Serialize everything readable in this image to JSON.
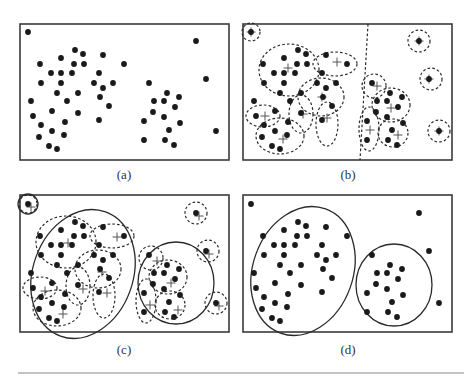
{
  "figure": {
    "panels": [
      {
        "id": "a",
        "label": "(a)",
        "mode": "points"
      },
      {
        "id": "b",
        "label": "(b)",
        "mode": "micro-clusters"
      },
      {
        "id": "c",
        "label": "(c)",
        "mode": "macro-clusters-over-micro"
      },
      {
        "id": "d",
        "label": "(d)",
        "mode": "final-clusters"
      }
    ],
    "points": [
      [
        8,
        8
      ],
      [
        55,
        26
      ],
      [
        63,
        30
      ],
      [
        83,
        31
      ],
      [
        41,
        34
      ],
      [
        20,
        40
      ],
      [
        54,
        40
      ],
      [
        64,
        40
      ],
      [
        104,
        40
      ],
      [
        31,
        49
      ],
      [
        41,
        49
      ],
      [
        52,
        49
      ],
      [
        79,
        49
      ],
      [
        21,
        59
      ],
      [
        41,
        59
      ],
      [
        74,
        59
      ],
      [
        93,
        59
      ],
      [
        83,
        64
      ],
      [
        37,
        69
      ],
      [
        58,
        69
      ],
      [
        80,
        73
      ],
      [
        11,
        77
      ],
      [
        47,
        77
      ],
      [
        89,
        82
      ],
      [
        32,
        87
      ],
      [
        58,
        89
      ],
      [
        13,
        92
      ],
      [
        79,
        96
      ],
      [
        45,
        98
      ],
      [
        21,
        101
      ],
      [
        32,
        107
      ],
      [
        44,
        111
      ],
      [
        19,
        113
      ],
      [
        29,
        122
      ],
      [
        37,
        125
      ],
      [
        176,
        17
      ],
      [
        186,
        55
      ],
      [
        196,
        107
      ],
      [
        129,
        59
      ],
      [
        147,
        69
      ],
      [
        159,
        73
      ],
      [
        134,
        77
      ],
      [
        144,
        77
      ],
      [
        155,
        83
      ],
      [
        133,
        88
      ],
      [
        144,
        93
      ],
      [
        124,
        97
      ],
      [
        160,
        99
      ],
      [
        149,
        106
      ],
      [
        124,
        116
      ],
      [
        145,
        116
      ],
      [
        154,
        121
      ]
    ],
    "micro_clusters": [
      {
        "cx": 8,
        "cy": 8,
        "rx": 9,
        "ry": 9,
        "center": [
          8,
          8
        ]
      },
      {
        "cx": 46,
        "cy": 46,
        "rx": 30,
        "ry": 26,
        "center": [
          45,
          44
        ]
      },
      {
        "cx": 92,
        "cy": 40,
        "rx": 22,
        "ry": 12,
        "center": [
          94,
          38
        ]
      },
      {
        "cx": 78,
        "cy": 73,
        "rx": 23,
        "ry": 19,
        "center": [
          79,
          73
        ]
      },
      {
        "cx": 20,
        "cy": 92,
        "rx": 17,
        "ry": 11,
        "center": [
          22,
          92
        ]
      },
      {
        "cx": 58,
        "cy": 90,
        "rx": 12,
        "ry": 19,
        "center": [
          60,
          90
        ]
      },
      {
        "cx": 84,
        "cy": 100,
        "rx": 11,
        "ry": 22,
        "center": [
          84,
          94
        ]
      },
      {
        "cx": 37,
        "cy": 112,
        "rx": 24,
        "ry": 18,
        "center": [
          40,
          115
        ]
      },
      {
        "cx": 176,
        "cy": 17,
        "rx": 11,
        "ry": 11,
        "center": [
          176,
          17
        ]
      },
      {
        "cx": 188,
        "cy": 55,
        "rx": 11,
        "ry": 11,
        "center": [
          186,
          55
        ]
      },
      {
        "cx": 196,
        "cy": 107,
        "rx": 11,
        "ry": 11,
        "center": [
          196,
          107
        ]
      },
      {
        "cx": 131,
        "cy": 62,
        "rx": 12,
        "ry": 12,
        "center": [
          134,
          62
        ]
      },
      {
        "cx": 148,
        "cy": 81,
        "rx": 19,
        "ry": 17,
        "center": [
          148,
          84
        ]
      },
      {
        "cx": 126,
        "cy": 105,
        "rx": 10,
        "ry": 22,
        "center": [
          127,
          106
        ]
      },
      {
        "cx": 150,
        "cy": 109,
        "rx": 15,
        "ry": 14,
        "center": [
          155,
          111
        ]
      }
    ],
    "separator": {
      "x_top": 125,
      "x_bottom": 117
    },
    "macro_clusters": [
      {
        "cx": 8,
        "cy": 8,
        "rx": 10,
        "ry": 10
      },
      {
        "cx": 63,
        "cy": 78,
        "rx": 50,
        "ry": 66,
        "rot": 20
      },
      {
        "cx": 156,
        "cy": 87,
        "rx": 38,
        "ry": 41,
        "rot": 0
      }
    ],
    "final_clusters": [
      {
        "cx": 60,
        "cy": 75,
        "rx": 50,
        "ry": 66,
        "rot": 20
      },
      {
        "cx": 151,
        "cy": 89,
        "rx": 38,
        "ry": 41,
        "rot": 0
      }
    ]
  }
}
